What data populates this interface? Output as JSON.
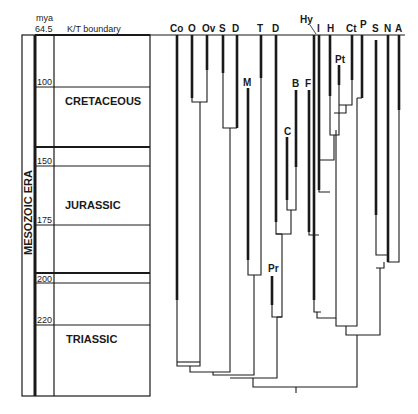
{
  "timescale": {
    "unit_label": "mya",
    "top_value": "64.5",
    "boundary_label": "K/T boundary",
    "era_label": "MESOZOIC ERA",
    "ticks": [
      {
        "label": "100",
        "y": 87
      },
      {
        "label": "150",
        "y": 166
      },
      {
        "label": "175",
        "y": 225
      },
      {
        "label": "200",
        "y": 283
      },
      {
        "label": "220",
        "y": 325
      }
    ],
    "periods": [
      {
        "name": "CRETACEOUS",
        "top": 35,
        "bottom": 147
      },
      {
        "name": "JURASSIC",
        "top": 147,
        "bottom": 273
      },
      {
        "name": "TRIASSIC",
        "top": 273,
        "bottom": 396
      }
    ]
  },
  "taxa": [
    {
      "label": "Co",
      "x": 177
    },
    {
      "label": "O",
      "x": 192
    },
    {
      "label": "Ov",
      "x": 207
    },
    {
      "label": "S",
      "x": 223
    },
    {
      "label": "D",
      "x": 237
    },
    {
      "label": "M",
      "x": 248
    },
    {
      "label": "T",
      "x": 260
    },
    {
      "label": "D",
      "x": 276
    },
    {
      "label": "C",
      "x": 287
    },
    {
      "label": "B",
      "x": 296
    },
    {
      "label": "F",
      "x": 308
    },
    {
      "label": "Hy",
      "x": 313
    },
    {
      "label": "I",
      "x": 318
    },
    {
      "label": "H",
      "x": 330
    },
    {
      "label": "Pt",
      "x": 339
    },
    {
      "label": "Ct",
      "x": 352
    },
    {
      "label": "P",
      "x": 361
    },
    {
      "label": "S",
      "x": 376
    },
    {
      "label": "N",
      "x": 388
    },
    {
      "label": "A",
      "x": 398
    },
    {
      "label": "Pr",
      "x": 272
    }
  ],
  "colors": {
    "line": "#1a1a1a",
    "background": "#ffffff"
  }
}
